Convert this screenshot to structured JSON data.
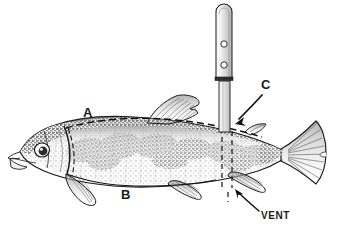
{
  "figure": {
    "background_color": "#ffffff",
    "ink_color": "#1a1a1a",
    "width": 355,
    "height": 239
  },
  "labels": {
    "a": "A",
    "b": "B",
    "c": "C",
    "vent": "VENT"
  },
  "subject": {
    "species_depiction": "trout-like fish, lateral left view, head at left, tail at right",
    "body_shading": "stippled grey mottled pattern, dark dorsal surface fading to pale belly",
    "parts": [
      "head",
      "eye",
      "mouth",
      "gill-cover",
      "pectoral-fin",
      "dorsal-fin",
      "adipose-fin",
      "pelvic-fin",
      "anal-fin",
      "caudal-fin"
    ]
  },
  "tool": {
    "name": "knife",
    "handle": "rounded-top flat handle with two rivet holes",
    "rivet_count": 2,
    "bolster": "dark band between handle and blade",
    "blade": "narrow vertical blade entering the fish at the vent"
  },
  "guides": {
    "dorsal_dashed_line": "dashed line A running along the back from behind the head past the dorsal fin",
    "ventral_curve_line": "curved line B running along the belly from the pectoral fin toward the anal region",
    "vertical_dashed_pair": "two short vertical dashed lines at the cut location above and below the vent",
    "arrow_c": "arrow pointing down-left to the adipose/body area where the blade enters",
    "arrow_vent": "arrow pointing up-left to the vent opening"
  }
}
